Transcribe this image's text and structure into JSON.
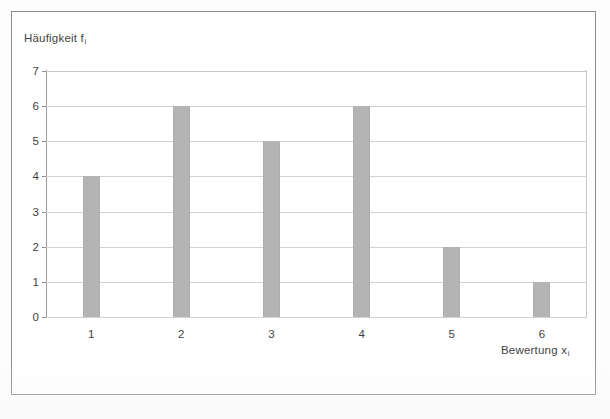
{
  "figure": {
    "y_axis_title_text": "Häufigkeit f",
    "y_axis_title_sub": "i",
    "x_axis_title_text": "Bewertung x",
    "x_axis_title_sub": "i"
  },
  "chart_data": {
    "type": "bar",
    "title": "",
    "subtitle": "",
    "xlabel": "Bewertung x_i",
    "ylabel": "Häufigkeit f_i",
    "categories": [
      "1",
      "2",
      "3",
      "4",
      "5",
      "6"
    ],
    "values": [
      4,
      6,
      5,
      6,
      2,
      1
    ],
    "ylim": [
      0,
      7
    ],
    "xlim_categories": 6,
    "y_ticks": [
      "0",
      "1",
      "2",
      "3",
      "4",
      "5",
      "6",
      "7"
    ],
    "y_tick_values": [
      0,
      1,
      2,
      3,
      4,
      5,
      6,
      7
    ],
    "grid": "horizontal",
    "legend": "none",
    "bar_color": "#b4b4b4",
    "gridline_color": "#d2d2d2",
    "axis_color": "#8f8f8f",
    "background_color": "#ffffff",
    "frame_color": "#8d8d8d",
    "annotations": []
  }
}
